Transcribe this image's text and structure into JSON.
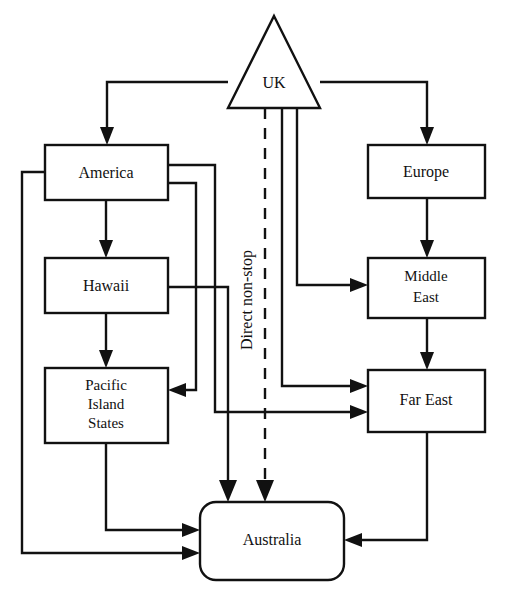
{
  "diagram": {
    "colors": {
      "stroke": "#111111",
      "fill": "#ffffff"
    },
    "nodes": [
      {
        "id": "uk",
        "label": "UK",
        "shape": "triangle"
      },
      {
        "id": "america",
        "label": "America",
        "shape": "rect"
      },
      {
        "id": "hawaii",
        "label": "Hawaii",
        "shape": "rect"
      },
      {
        "id": "pacific",
        "label": "Pacific Island States",
        "label_lines": [
          "Pacific",
          "Island",
          "States"
        ],
        "shape": "rect"
      },
      {
        "id": "europe",
        "label": "Europe",
        "shape": "rect"
      },
      {
        "id": "middle",
        "label": "Middle East",
        "label_lines": [
          "Middle",
          "East"
        ],
        "shape": "rect"
      },
      {
        "id": "fareast",
        "label": "Far East",
        "shape": "rect"
      },
      {
        "id": "australia",
        "label": "Australia",
        "shape": "rounded-rect"
      }
    ],
    "node_labels": {
      "uk": "UK",
      "america": "America",
      "hawaii": "Hawaii",
      "pacific_1": "Pacific",
      "pacific_2": "Island",
      "pacific_3": "States",
      "europe": "Europe",
      "middle_1": "Middle",
      "middle_2": "East",
      "fareast": "Far East",
      "australia": "Australia"
    },
    "edge_labels": {
      "direct": "Direct non-stop"
    },
    "edges": [
      {
        "from": "uk",
        "to": "america",
        "style": "solid"
      },
      {
        "from": "uk",
        "to": "europe",
        "style": "solid"
      },
      {
        "from": "uk",
        "to": "middle",
        "style": "solid"
      },
      {
        "from": "uk",
        "to": "fareast",
        "style": "solid"
      },
      {
        "from": "uk",
        "to": "australia",
        "style": "dashed",
        "label": "Direct non-stop"
      },
      {
        "from": "america",
        "to": "hawaii",
        "style": "solid"
      },
      {
        "from": "america",
        "to": "pacific",
        "style": "solid"
      },
      {
        "from": "america",
        "to": "fareast",
        "style": "solid"
      },
      {
        "from": "america",
        "to": "australia",
        "style": "solid"
      },
      {
        "from": "hawaii",
        "to": "pacific",
        "style": "solid"
      },
      {
        "from": "hawaii",
        "to": "australia",
        "style": "solid"
      },
      {
        "from": "pacific",
        "to": "australia",
        "style": "solid"
      },
      {
        "from": "europe",
        "to": "middle",
        "style": "solid"
      },
      {
        "from": "middle",
        "to": "fareast",
        "style": "solid"
      },
      {
        "from": "fareast",
        "to": "australia",
        "style": "solid"
      }
    ]
  }
}
